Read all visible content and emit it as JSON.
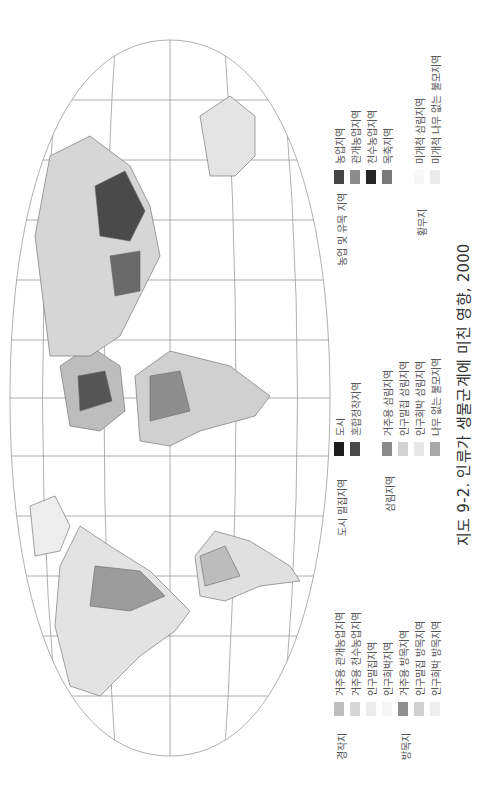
{
  "caption": "지도 9-2. 인류가 생물군계에 미친 영향, 2000",
  "colors": {
    "grid": "#9a9a9a",
    "land_light": "#e6e6e6",
    "land_mid": "#bdbdbd",
    "land_dark": "#555555",
    "coast": "#666666"
  },
  "legend": {
    "groups": [
      {
        "title": "경작지",
        "items": [
          {
            "label": "거주용 관개농업지역",
            "color": "#bdbdbd"
          },
          {
            "label": "거주용 천수농업지역",
            "color": "#d6d6d6"
          },
          {
            "label": "인구밀집지역",
            "color": "#ececec"
          },
          {
            "label": "인구희박지역",
            "color": "#f6f6f6"
          }
        ]
      },
      {
        "title": "방목지",
        "items": [
          {
            "label": "거주용 방목지역",
            "color": "#8f8f8f"
          },
          {
            "label": "인구밀집 방목지역",
            "color": "#cfcfcf"
          },
          {
            "label": "인구희박 방목지역",
            "color": "#ededed"
          }
        ]
      },
      {
        "title": "도시 밀집지역",
        "items": [
          {
            "label": "도시",
            "color": "#1c1c1c"
          },
          {
            "label": "혼합정착지역",
            "color": "#4a4a4a"
          }
        ]
      },
      {
        "title": "삼림지역",
        "items": [
          {
            "label": "거주용 삼림지역",
            "color": "#8a8a8a"
          },
          {
            "label": "인구밀집 삼림지역",
            "color": "#d2d2d2"
          },
          {
            "label": "인구희박 삼림지역",
            "color": "#e8e8e8"
          },
          {
            "label": "나무 없는 불모지역",
            "color": "#a8a8a8"
          }
        ]
      },
      {
        "title": "농업 및 유목 지역",
        "items": [
          {
            "label": "농업지역",
            "color": "#454545"
          },
          {
            "label": "관개농업지역",
            "color": "#8c8c8c"
          },
          {
            "label": "천수농업지역",
            "color": "#262626"
          },
          {
            "label": "목축지역",
            "color": "#7a7a7a"
          }
        ]
      },
      {
        "title": "황무지",
        "items": [
          {
            "label": "미개척 삼림지역",
            "color": "#f7f7f7"
          },
          {
            "label": "미개척 나무 없는 불모지역",
            "color": "#ebebeb"
          }
        ]
      }
    ]
  }
}
